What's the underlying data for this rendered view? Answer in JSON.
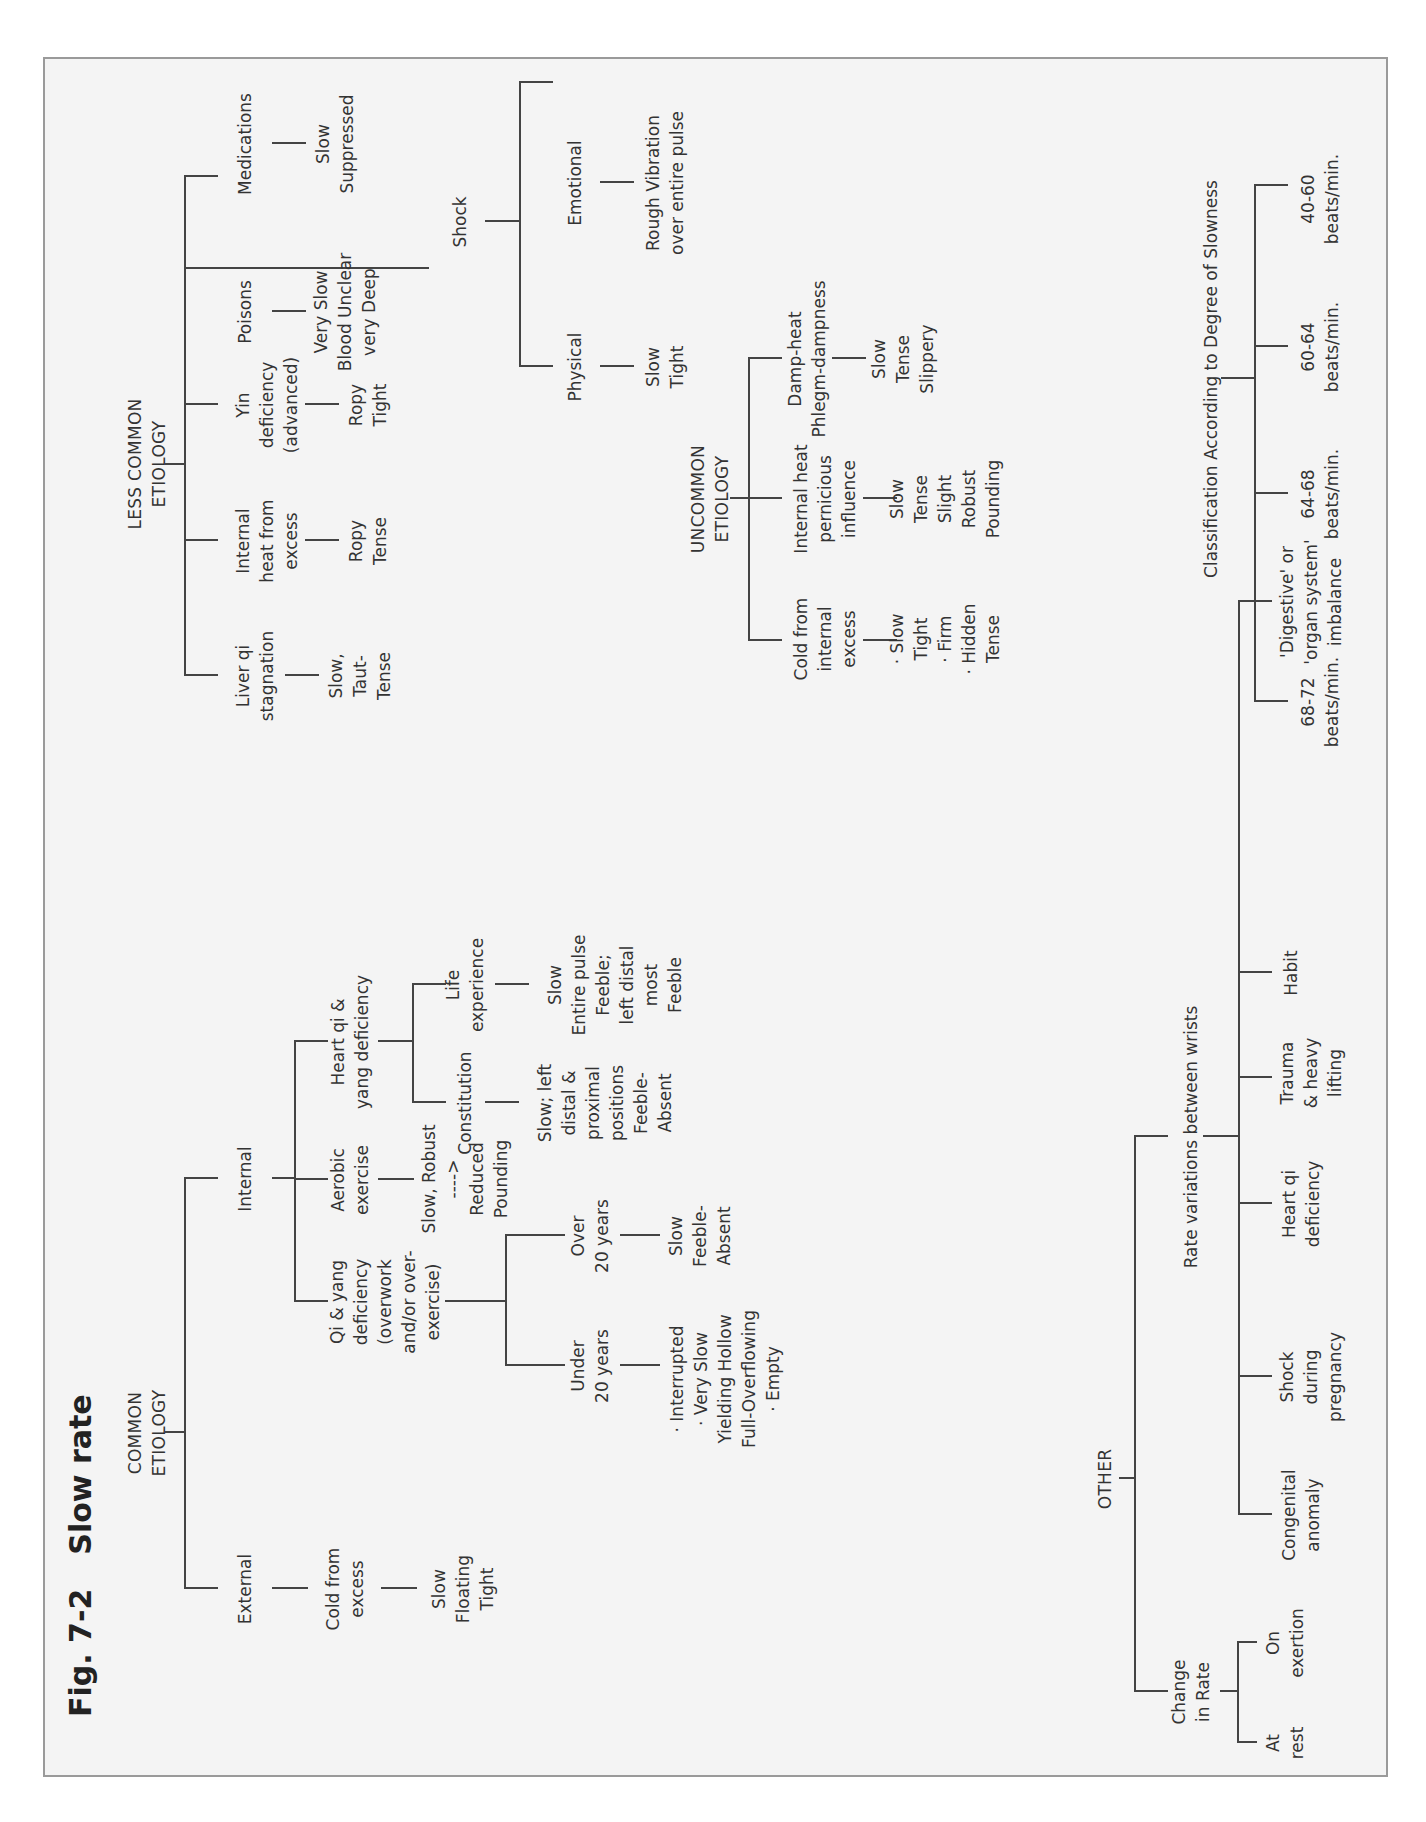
{
  "page_header": "",
  "figure": {
    "number": "Fig. 7-2",
    "title": "Slow rate"
  },
  "common_etiology": {
    "label": "COMMON\nETIOLOGY",
    "external": {
      "label": "External",
      "child": "Cold from\nexcess",
      "result": "Slow\nFloating\nTight"
    },
    "internal": {
      "label": "Internal",
      "qi_yang": {
        "label": "Qi & yang\ndeficiency\n(overwork\nand/or over-\nexercise)",
        "under20": {
          "label": "Under\n20 years",
          "result": "· Interrupted\n· Very Slow\nYielding Hollow\nFull-Overflowing\n· Empty"
        },
        "over20": {
          "label": "Over\n20 years",
          "result": "Slow\nFeeble-\nAbsent"
        }
      },
      "aerobic": {
        "label": "Aerobic\nexercise",
        "result": "Slow, Robust\n---->\nReduced\nPounding"
      },
      "heart": {
        "label": "Heart qi &\nyang deficiency",
        "constitution": {
          "label": "Constitution",
          "result": "Slow; left\ndistal &\nproximal\npositions\nFeeble-\nAbsent"
        },
        "life": {
          "label": "Life\nexperience",
          "result": "Slow\nEntire pulse\nFeeble;\nleft distal\nmost\nFeeble"
        }
      }
    }
  },
  "less_common_etiology": {
    "label": "LESS COMMON\nETIOLOGY",
    "items": [
      {
        "label": "Liver qi\nstagnation",
        "result": "Slow,\nTaut-\nTense"
      },
      {
        "label": "Internal\nheat from\nexcess",
        "result": "Ropy\nTense"
      },
      {
        "label": "Yin\ndeficiency\n(advanced)",
        "result": "Ropy\nTight"
      },
      {
        "label": "Poisons",
        "result": "Very Slow\nBlood Unclear\nvery Deep"
      },
      {
        "label": "Medications",
        "result": "Slow\nSuppressed"
      }
    ],
    "shock": {
      "label": "Shock",
      "physical": {
        "label": "Physical",
        "result": "Slow\nTight"
      },
      "emotional": {
        "label": "Emotional",
        "result": "Rough Vibration\nover entire pulse"
      }
    }
  },
  "uncommon_etiology": {
    "label": "UNCOMMON\nETIOLOGY",
    "items": [
      {
        "label": "Cold from\ninternal\nexcess",
        "result": "· Slow\nTight\n· Firm\n· Hidden\nTense"
      },
      {
        "label": "Internal heat\npernicious\ninfluence",
        "result": "Slow\nTense\nSlight\nRobust\nPounding"
      },
      {
        "label": "Damp-heat\nPhlegm-dampness",
        "result": "Slow\nTense\nSlippery"
      }
    ]
  },
  "classification": {
    "label": "Classification According to Degree of Slowness",
    "ranges": [
      "68-72\nbeats/min.",
      "64-68\nbeats/min.",
      "60-64\nbeats/min.",
      "40-60\nbeats/min."
    ]
  },
  "other": {
    "label": "OTHER",
    "change_in_rate": {
      "label": "Change\nin Rate",
      "items": [
        "At\nrest",
        "On\nexertion"
      ]
    },
    "rate_variations": {
      "label": "Rate variations between wrists",
      "items": [
        "Congenital\nanomaly",
        "Shock\nduring\npregnancy",
        "Heart qi\ndeficiency",
        "Trauma\n& heavy\nlifting",
        "Habit",
        "'Digestive' or\n'organ system'\nimbalance"
      ]
    }
  },
  "colors": {
    "frame_border": "#9a9a9a",
    "frame_bg": "#f4f4f4",
    "line": "#444444",
    "text": "#333333"
  }
}
